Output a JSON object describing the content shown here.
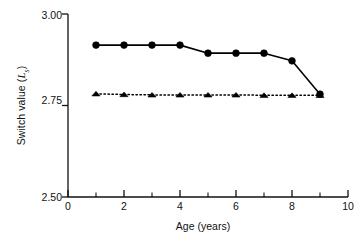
{
  "chart_data": {
    "type": "line",
    "title": "",
    "xlabel": "Age (years)",
    "ylabel_prefix": "Switch value (",
    "ylabel_symbol": "L",
    "ylabel_subscript": "s",
    "ylabel_suffix": ")",
    "ylabel_plain": "Switch value (Ls)",
    "x": [
      1,
      2,
      3,
      4,
      5,
      6,
      7,
      8,
      9
    ],
    "xlim": [
      0,
      10
    ],
    "ylim": [
      2.5,
      3.0
    ],
    "xticks": [
      0,
      2,
      4,
      6,
      8,
      10
    ],
    "xtick_labels": [
      "0",
      "2",
      "4",
      "6",
      "8",
      "10"
    ],
    "xminor_ticks": [
      1,
      3,
      5,
      7,
      9
    ],
    "yticks": [
      2.5,
      2.75,
      3.0
    ],
    "ytick_labels": [
      "2.50",
      "2.75",
      "3.00"
    ],
    "grid": false,
    "legend": "none",
    "series": [
      {
        "name": "circle-series",
        "marker": "circle",
        "linestyle": "solid",
        "color": "#000000",
        "values": [
          2.915,
          2.915,
          2.915,
          2.915,
          2.893,
          2.893,
          2.893,
          2.872,
          2.781
        ]
      },
      {
        "name": "triangle-series",
        "marker": "triangle",
        "linestyle": "dotted",
        "color": "#000000",
        "values": [
          2.782,
          2.78,
          2.779,
          2.779,
          2.779,
          2.779,
          2.778,
          2.778,
          2.778
        ]
      }
    ]
  }
}
